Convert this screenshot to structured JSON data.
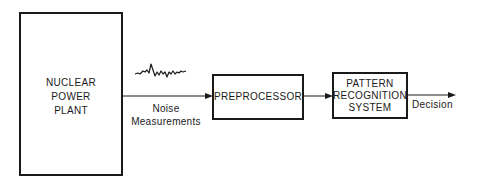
{
  "diagram": {
    "type": "block-diagram",
    "nodes": [
      {
        "id": "plant",
        "lines": [
          "NUCLEAR",
          "POWER",
          "PLANT"
        ]
      },
      {
        "id": "preprocessor",
        "lines": [
          "PREPROCESSOR"
        ]
      },
      {
        "id": "pattern",
        "lines": [
          "PATTERN",
          "RECOGNITION",
          "SYSTEM"
        ]
      }
    ],
    "edges": [
      {
        "from": "plant",
        "to": "preprocessor",
        "label_lines": [
          "Noise",
          "Measurements"
        ],
        "icon": "noise-waveform-icon"
      },
      {
        "from": "preprocessor",
        "to": "pattern",
        "label_lines": []
      },
      {
        "from": "pattern",
        "to": "output",
        "label_lines": [
          "Decision"
        ]
      }
    ]
  }
}
